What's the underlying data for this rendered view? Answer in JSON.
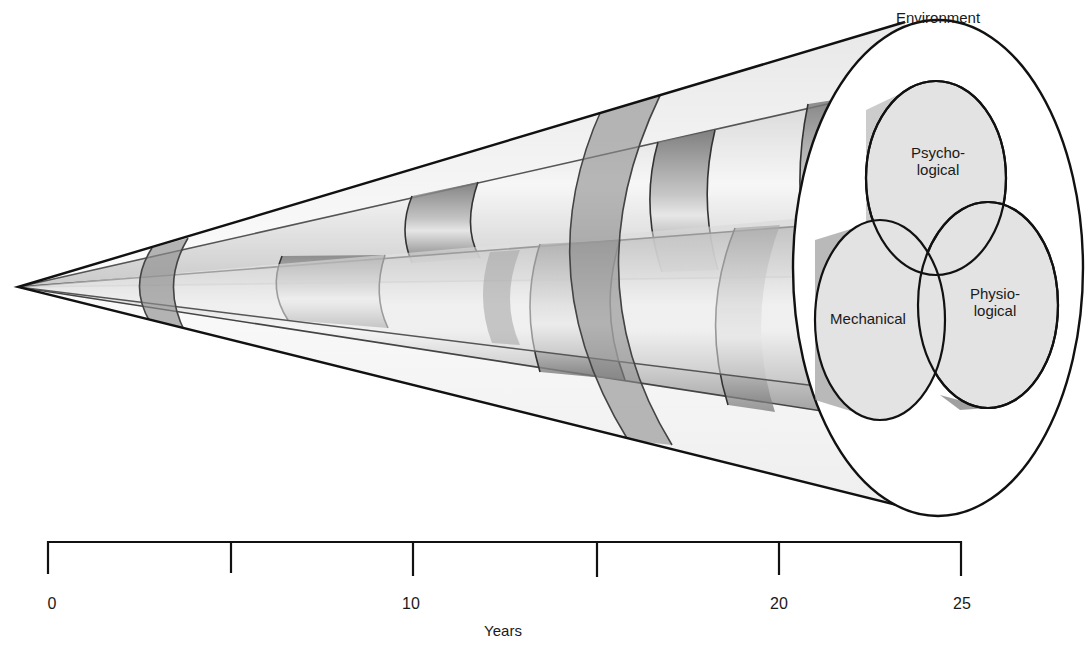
{
  "diagram": {
    "type": "cone-of-development",
    "outer_region": {
      "label": "Environment"
    },
    "components": [
      {
        "id": "psychological",
        "label": "Psycho-\nlogical",
        "line1": "Psycho-",
        "line2": "logical"
      },
      {
        "id": "mechanical",
        "label": "Mechanical"
      },
      {
        "id": "physiological",
        "label": "Physio-\nlogical",
        "line1": "Physio-",
        "line2": "logical"
      }
    ],
    "colors": {
      "outline": "#111111",
      "cone_fill": "#f2f2f2",
      "tube_light": "#ececec",
      "tube_dark": "#7a7a7a",
      "band": "#8c8c8c",
      "face_fill": "#e2e2e2"
    }
  },
  "axis": {
    "title": "Years",
    "min": 0,
    "max": 25,
    "major_ticks": [
      0,
      5,
      10,
      15,
      20,
      25
    ],
    "tick_labels": [
      {
        "value": 0,
        "label": "0"
      },
      {
        "value": 10,
        "label": "10"
      },
      {
        "value": 20,
        "label": "20"
      },
      {
        "value": 25,
        "label": "25"
      }
    ]
  }
}
